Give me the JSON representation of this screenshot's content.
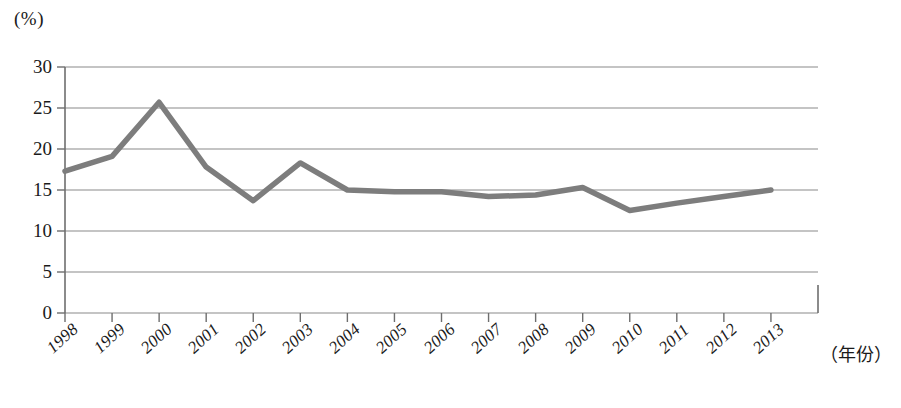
{
  "chart_data": {
    "type": "line",
    "title": "",
    "subtitle": "",
    "xlabel": "（年份）",
    "ylabel": "(%)",
    "unit_label": "(%)",
    "categories": [
      "1998",
      "1999",
      "2000",
      "2001",
      "2002",
      "2003",
      "2004",
      "2005",
      "2006",
      "2007",
      "2008",
      "2009",
      "2010",
      "2011",
      "2012",
      "2013"
    ],
    "values": [
      17.3,
      19.1,
      25.7,
      17.8,
      13.7,
      18.3,
      15.0,
      14.8,
      14.8,
      14.2,
      14.4,
      15.3,
      12.5,
      13.4,
      14.2,
      15.0
    ],
    "series": [
      {
        "name": "",
        "values": [
          17.3,
          19.1,
          25.7,
          17.8,
          13.7,
          18.3,
          15.0,
          14.8,
          14.8,
          14.2,
          14.4,
          15.3,
          12.5,
          13.4,
          14.2,
          15.0
        ]
      }
    ],
    "ylim": [
      0,
      30
    ],
    "yticks": [
      0,
      5,
      10,
      15,
      20,
      25,
      30
    ],
    "ytick_labels": [
      "0",
      "5",
      "10",
      "15",
      "20",
      "25",
      "30"
    ],
    "xtick_labels": [
      "1998",
      "1999",
      "2000",
      "2001",
      "2002",
      "2003",
      "2004",
      "2005",
      "2006",
      "2007",
      "2008",
      "2009",
      "2010",
      "2011",
      "2012",
      "2013"
    ],
    "grid": true,
    "grid_axis": "y",
    "legend": false,
    "legend_position": "none",
    "line_color": "#7d7d7d",
    "grid_color": "#8a8a8a",
    "axis_color": "#6e6e6e",
    "background_color": "#ffffff",
    "text_color": "#1a1a1a",
    "annotations": []
  }
}
